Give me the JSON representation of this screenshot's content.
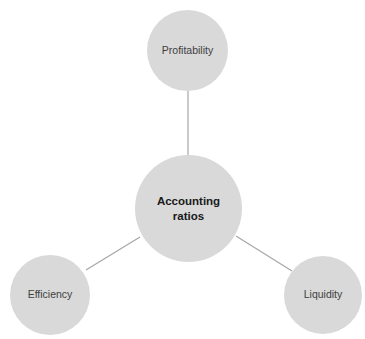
{
  "diagram": {
    "type": "hub-and-spoke",
    "colors": {
      "node_fill": "#d9d9d9",
      "connector": "#a6a6a6",
      "label_text": "#404040",
      "center_text": "#1a1a1a"
    },
    "center": {
      "label": "Accounting ratios"
    },
    "spokes": [
      {
        "id": "top",
        "label": "Profitability"
      },
      {
        "id": "left",
        "label": "Efficiency"
      },
      {
        "id": "right",
        "label": "Liquidity"
      }
    ]
  }
}
